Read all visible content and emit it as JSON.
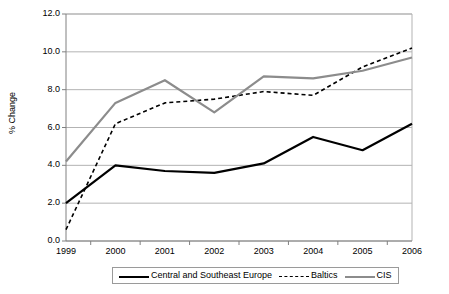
{
  "chart_data": {
    "type": "line",
    "title": "",
    "xlabel": "",
    "ylabel": "% Change",
    "categories": [
      "1999",
      "2000",
      "2001",
      "2002",
      "2003",
      "2004",
      "2005",
      "2006"
    ],
    "ylim": [
      0.0,
      12.0
    ],
    "yticks": [
      "0.0",
      "2.0",
      "4.0",
      "6.0",
      "8.0",
      "10.0",
      "12.0"
    ],
    "ytick_values": [
      0.0,
      2.0,
      4.0,
      6.0,
      8.0,
      10.0,
      12.0
    ],
    "grid": "horizontal",
    "legend_position": "bottom",
    "series": [
      {
        "name": "Central and Southeast Europe",
        "style": "solid",
        "color": "#000000",
        "values": [
          2.0,
          4.0,
          3.7,
          3.6,
          4.1,
          5.5,
          4.8,
          6.2
        ]
      },
      {
        "name": "Baltics",
        "style": "dashed",
        "color": "#000000",
        "values": [
          0.6,
          6.2,
          7.3,
          7.5,
          7.9,
          7.7,
          9.2,
          10.2
        ]
      },
      {
        "name": "CIS",
        "style": "solid",
        "color": "#8c8c8c",
        "values": [
          4.2,
          7.3,
          8.5,
          6.8,
          8.7,
          8.6,
          9.0,
          9.7
        ]
      }
    ]
  },
  "axis": {
    "y_title": "% Change"
  },
  "legend": {
    "items": [
      {
        "label": "Central and Southeast Europe"
      },
      {
        "label": "Baltics"
      },
      {
        "label": "CIS"
      }
    ]
  },
  "colors": {
    "series_dark": "#000000",
    "series_gray": "#8c8c8c",
    "grid": "#b3b3b3",
    "axis": "#808080",
    "background": "#ffffff"
  }
}
